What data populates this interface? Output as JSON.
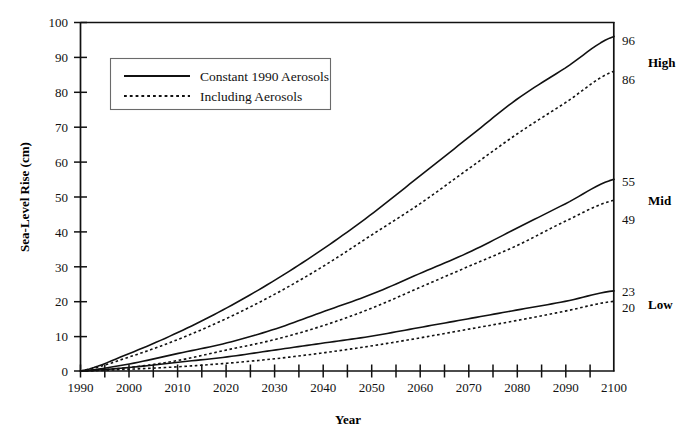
{
  "chart_data": {
    "type": "line",
    "title": "",
    "xlabel": "Year",
    "ylabel": "Sea-Level Rise (cm)",
    "xlim": [
      1990,
      2100
    ],
    "ylim": [
      0,
      100
    ],
    "grid": false,
    "legend_position": "upper-left",
    "x_ticks_labeled": [
      1990,
      2000,
      2010,
      2020,
      2030,
      2040,
      2050,
      2060,
      2070,
      2080,
      2090,
      2100
    ],
    "x_tick_step_minor": 5,
    "y_ticks": [
      0,
      10,
      20,
      30,
      40,
      50,
      60,
      70,
      80,
      90,
      100
    ],
    "x": [
      1990,
      2000,
      2010,
      2020,
      2030,
      2040,
      2050,
      2060,
      2070,
      2080,
      2090,
      2100
    ],
    "series": [
      {
        "name": "High — Constant 1990 Aerosols",
        "style": "solid",
        "scenario": "High",
        "end_value": 96,
        "values": [
          0,
          5,
          11,
          18,
          26,
          35,
          45,
          56,
          67,
          78,
          87,
          96
        ]
      },
      {
        "name": "High — Including Aerosols",
        "style": "dotted",
        "scenario": "High",
        "end_value": 86,
        "values": [
          0,
          4,
          9,
          15,
          22,
          30,
          39,
          48,
          58,
          68,
          77,
          86
        ]
      },
      {
        "name": "Mid — Constant 1990 Aerosols",
        "style": "solid",
        "scenario": "Mid",
        "end_value": 55,
        "values": [
          0,
          2,
          5,
          8,
          12,
          17,
          22,
          28,
          34,
          41,
          48,
          55
        ]
      },
      {
        "name": "Mid — Including Aerosols",
        "style": "dotted",
        "scenario": "Mid",
        "end_value": 49,
        "values": [
          0,
          1,
          3,
          6,
          9,
          13,
          18,
          24,
          30,
          36,
          43,
          49
        ]
      },
      {
        "name": "Low — Constant 1990 Aerosols",
        "style": "solid",
        "scenario": "Low",
        "end_value": 23,
        "values": [
          0,
          1,
          2.5,
          4,
          6,
          8,
          10,
          12.5,
          15,
          17.5,
          20,
          23
        ]
      },
      {
        "name": "Low — Including Aerosols",
        "style": "dotted",
        "scenario": "Low",
        "end_value": 20,
        "values": [
          0,
          0.5,
          1.2,
          2.2,
          3.5,
          5.2,
          7.2,
          9.5,
          12,
          14.5,
          17.2,
          20
        ]
      }
    ],
    "legend_entries": [
      {
        "label": "Constant 1990 Aerosols",
        "style": "solid"
      },
      {
        "label": "Including Aerosols",
        "style": "dotted"
      }
    ],
    "right_annotations": [
      {
        "scenario": "High",
        "upper": "96",
        "lower": "86"
      },
      {
        "scenario": "Mid",
        "upper": "55",
        "lower": "49"
      },
      {
        "scenario": "Low",
        "upper": "23",
        "lower": "20"
      }
    ],
    "colors": {
      "line": "#111111",
      "axis": "#111111",
      "legend_border": "#6a6a6a",
      "background": "#ffffff"
    }
  },
  "axis": {
    "y_labels": [
      "100",
      "90",
      "80",
      "70",
      "60",
      "50",
      "40",
      "30",
      "20",
      "10",
      "0"
    ],
    "x_labels": [
      "1990",
      "2000",
      "2010",
      "2020",
      "2030",
      "2040",
      "2050",
      "2060",
      "2070",
      "2080",
      "2090",
      "2100"
    ],
    "y_title": "Sea-Level Rise (cm)",
    "x_title": "Year"
  },
  "legend": {
    "items": [
      {
        "label": "Constant 1990 Aerosols",
        "swatch": "solid-line-swatch"
      },
      {
        "label": "Including Aerosols",
        "swatch": "dotted-line-swatch"
      }
    ]
  },
  "annotations": {
    "high_upper": "96",
    "high_lower": "86",
    "high_name": "High",
    "mid_upper": "55",
    "mid_lower": "49",
    "mid_name": "Mid",
    "low_upper": "23",
    "low_lower": "20",
    "low_name": "Low"
  }
}
